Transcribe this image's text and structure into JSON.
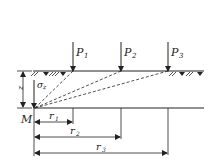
{
  "diagram": {
    "type": "stress-superposition-point-loads",
    "loads": [
      {
        "label": "P",
        "sub": "1",
        "x": 73
      },
      {
        "label": "P",
        "sub": "2",
        "x": 121
      },
      {
        "label": "P",
        "sub": "3",
        "x": 168
      }
    ],
    "point_label": "M",
    "depth_label": "z",
    "stress_label": "σ",
    "stress_sub": "z",
    "radii": [
      {
        "label": "r",
        "sub": "1"
      },
      {
        "label": "r",
        "sub": "2"
      },
      {
        "label": "r",
        "sub": "3"
      }
    ],
    "colors": {
      "line": "#222222",
      "background": "#ffffff"
    }
  }
}
